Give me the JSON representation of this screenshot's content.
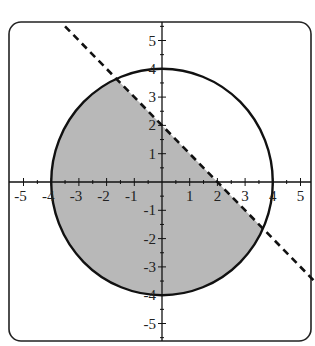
{
  "chart_data": {
    "type": "area",
    "title": "",
    "xlabel": "",
    "ylabel": "",
    "xlim": [
      -5.6,
      5.4
    ],
    "ylim": [
      -5.6,
      5.6
    ],
    "grid": false,
    "x_ticks": [
      -5,
      -4,
      -3,
      -2,
      -1,
      1,
      2,
      3,
      4,
      5
    ],
    "y_ticks": [
      5,
      4,
      3,
      2,
      1,
      -1,
      -2,
      -3,
      -4,
      -5
    ],
    "x_tick_labels": [
      "-5",
      "-4",
      "-3",
      "-2",
      "-1",
      "1",
      "2",
      "3",
      "4",
      "5"
    ],
    "y_tick_labels": [
      "5",
      "4",
      "3",
      "2",
      "1",
      "-1",
      "-2",
      "-3",
      "-4",
      "-5"
    ],
    "minor_tick_step": 0.5,
    "curves": [
      {
        "name": "circle",
        "equation": "x^2 + y^2 = 16",
        "center": [
          0,
          0
        ],
        "radius": 4,
        "style": "solid",
        "color": "#111111"
      },
      {
        "name": "boundary-line",
        "equation": "y = -x + 2",
        "slope": -1,
        "intercept": 2,
        "x_range": [
          -3.5,
          5.5
        ],
        "style": "dashed",
        "color": "#111111"
      }
    ],
    "shaded_region": {
      "description": "x^2 + y^2 <= 16 and y <= -x + 2",
      "fill_color": "#b8b8b8",
      "intersection_points": [
        [
          -1.65,
          3.65
        ],
        [
          3.65,
          -1.65
        ]
      ]
    },
    "colors": {
      "frame": "#222222",
      "axes": "#111111",
      "background": "#ffffff"
    }
  }
}
